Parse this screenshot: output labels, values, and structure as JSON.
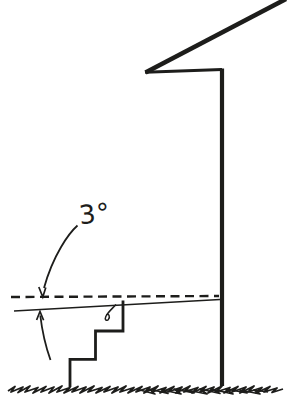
{
  "figure": {
    "angle_label": "3°",
    "colors": {
      "ink": "#1d1d1b",
      "background": "#ffffff"
    },
    "elements": {
      "roof": "roof overhang line",
      "wall": "house wall",
      "level_reference": "dashed level line",
      "slope": "sloped porch surface line",
      "stairs": "three-step stair outline",
      "ground": "ground scribble line",
      "angle_dimension": "3 degree slope annotation"
    }
  }
}
